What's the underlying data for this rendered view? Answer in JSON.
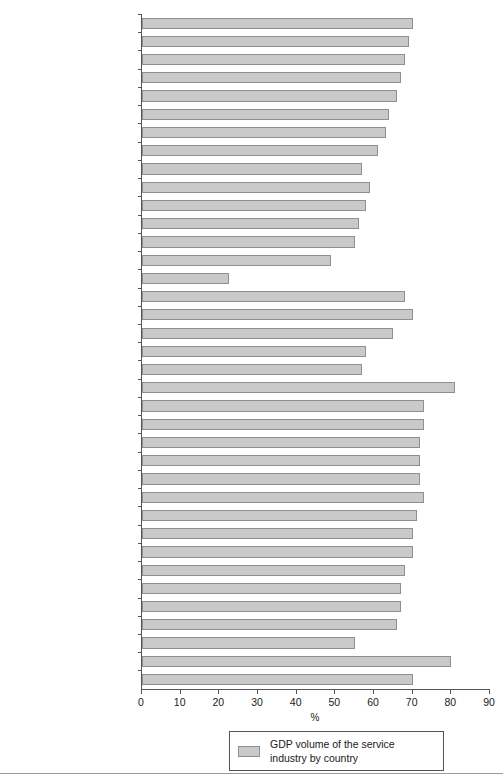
{
  "chart_data": {
    "type": "bar",
    "orientation": "horizontal",
    "title": "",
    "xlabel": "%",
    "ylabel": "",
    "xlim": [
      0,
      90
    ],
    "xticks": [
      0,
      10,
      20,
      30,
      40,
      50,
      60,
      70,
      80,
      90
    ],
    "grid": false,
    "legend": {
      "position": "bottom-center",
      "entries": [
        {
          "label_line1": "GDP volume of the service",
          "label_line2": "industry by country",
          "color": "#c9c9c9"
        }
      ]
    },
    "series_name": "GDP volume of the service industry by country",
    "categories": [
      "Latvia",
      "Estonia",
      "Poland",
      "Hungary",
      "Slovakia",
      "Croatia",
      "Lithuania",
      "Slovenia",
      "Macedonia",
      "Bulgaria",
      "Bosnia and Herzegovina",
      "Czech Republic",
      "Romania",
      "Serbia and Montenegro",
      "Albania",
      "Switzerland",
      "Malta",
      "Iceland",
      "Norway",
      "Turkey",
      "Luxembourg",
      "UK",
      "France",
      "Denmark",
      "Belgium",
      "Greece",
      "Netherlands",
      "Sweden",
      "Germany",
      "Italy",
      "Spain",
      "Portugal",
      "Austria",
      "Finland",
      "Ireland",
      "USA",
      "Canada"
    ],
    "values": [
      70,
      69,
      68,
      67,
      66,
      64,
      63,
      61,
      57,
      59,
      58,
      56,
      55,
      49,
      22.5,
      68,
      70,
      65,
      58,
      57,
      81,
      73,
      73,
      72,
      72,
      72,
      73,
      71,
      70,
      70,
      68,
      67,
      67,
      66,
      55,
      80,
      70
    ],
    "bar_color": "#c9c9c9",
    "bar_border_color": "#8f8f8f",
    "axis_color": "#555555"
  }
}
